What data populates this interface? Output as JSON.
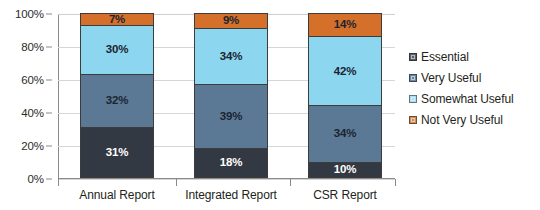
{
  "chart_data": {
    "type": "bar",
    "stacked": true,
    "stack_mode": "percent",
    "title": "",
    "subtitle": "",
    "xlabel": "",
    "ylabel": "",
    "ylim": [
      0,
      100
    ],
    "ytick_labels": [
      "0%",
      "20%",
      "40%",
      "60%",
      "80%",
      "100%"
    ],
    "ytick_values": [
      0,
      20,
      40,
      60,
      80,
      100
    ],
    "grid": true,
    "legend_position": "right",
    "categories": [
      "Annual Report",
      "Integrated Report",
      "CSR Report"
    ],
    "series": [
      {
        "name": "Essential",
        "color": "#333942",
        "label_color": "#ffffff",
        "values": [
          31,
          18,
          10
        ],
        "value_labels": [
          "31%",
          "18%",
          "10%"
        ]
      },
      {
        "name": "Very Useful",
        "color": "#5b7994",
        "label_color": "#1b2430",
        "values": [
          32,
          39,
          34
        ],
        "value_labels": [
          "32%",
          "39%",
          "34%"
        ]
      },
      {
        "name": "Somewhat Useful",
        "color": "#8dd6ef",
        "label_color": "#1b2430",
        "values": [
          30,
          34,
          42
        ],
        "value_labels": [
          "30%",
          "34%",
          "42%"
        ]
      },
      {
        "name": "Not Very Useful",
        "color": "#d4702a",
        "label_color": "#1b2430",
        "values": [
          7,
          9,
          14
        ],
        "value_labels": [
          "7%",
          "9%",
          "14%"
        ]
      }
    ]
  },
  "legend": {
    "items": [
      {
        "label": "Essential",
        "color": "#5a5f68"
      },
      {
        "label": "Very Useful",
        "color": "#6b87a0"
      },
      {
        "label": "Somewhat Useful",
        "color": "#a9dcef"
      },
      {
        "label": "Not Very Useful",
        "color": "#cf8a55"
      }
    ]
  },
  "colors": {
    "gridline": "#d6d6d6",
    "axis": "#8a8a8a",
    "text": "#231f20",
    "background": "#ffffff"
  }
}
